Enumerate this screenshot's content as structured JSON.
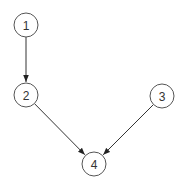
{
  "diagram": {
    "type": "directed-graph",
    "colors": {
      "stroke": "#555555",
      "edge": "#333333",
      "text": "#333333",
      "background": "#ffffff"
    },
    "nodes": [
      {
        "id": "1",
        "label": "1",
        "cx": 26,
        "cy": 25,
        "r": 12
      },
      {
        "id": "2",
        "label": "2",
        "cx": 26,
        "cy": 95,
        "r": 12
      },
      {
        "id": "3",
        "label": "3",
        "cx": 162,
        "cy": 96,
        "r": 12
      },
      {
        "id": "4",
        "label": "4",
        "cx": 94,
        "cy": 164,
        "r": 12
      }
    ],
    "edges": [
      {
        "from": "1",
        "to": "2"
      },
      {
        "from": "2",
        "to": "4"
      },
      {
        "from": "3",
        "to": "4"
      }
    ]
  }
}
